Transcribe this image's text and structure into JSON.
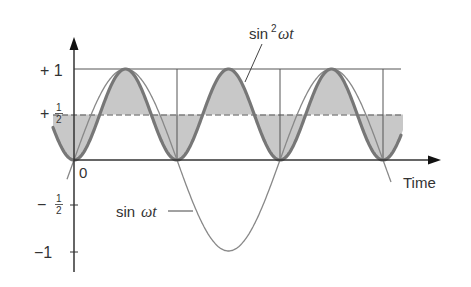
{
  "diagram": {
    "type": "waveform",
    "labels": {
      "y_plus_one": "+ 1",
      "y_plus_half_sign": "+",
      "y_minus_half_sign": "−",
      "y_minus_one": "−1",
      "half_num": "1",
      "half_den": "2",
      "origin": "0",
      "x_axis": "Time",
      "sin_squared_prefix": "sin",
      "sin_squared_exp": "2",
      "sin_squared_var": "ωt",
      "sin_prefix": "sin",
      "sin_var": "ωt"
    },
    "colors": {
      "axis": "#333333",
      "guide": "#555555",
      "sin_curve": "#888888",
      "sin_squared_curve": "#777777",
      "shading": "#c8c8c8"
    }
  },
  "chart_data": {
    "type": "line",
    "title": "",
    "xlabel": "Time",
    "ylabel": "",
    "ylim": [
      -1,
      1
    ],
    "yticks": [
      "+1",
      "+1/2",
      "0",
      "-1/2",
      "-1"
    ],
    "series": [
      {
        "name": "sin ωt",
        "function": "sin(ωt)",
        "range_wt": [
          -0.2,
          9.3
        ],
        "amplitude": 1
      },
      {
        "name": "sin² ωt",
        "function": "sin²(ωt)",
        "range_wt": [
          -0.64,
          9.73
        ],
        "mean": 0.5
      }
    ],
    "annotations": [
      "Shaded area between sin² ωt and mean line +1/2",
      "Dashed horizontal line at +1/2 (average of sin² ωt)",
      "Vertical guide lines at ωt = π, 2π, 3π",
      "Solid horizontal line at +1"
    ],
    "grid": false
  }
}
